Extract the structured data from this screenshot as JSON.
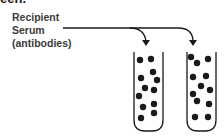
{
  "heading": "een.",
  "label": {
    "line1": "Recipient",
    "line2": "Serum",
    "line3": "(antibodies)"
  },
  "tubes": [
    {
      "name": "tube-1",
      "dots": [
        [
          140,
          60
        ],
        [
          151,
          59
        ],
        [
          153,
          72
        ],
        [
          141,
          78
        ],
        [
          157,
          80
        ],
        [
          145,
          88
        ],
        [
          154,
          90
        ],
        [
          139,
          96
        ],
        [
          143,
          107
        ],
        [
          154,
          104
        ],
        [
          141,
          118
        ],
        [
          154,
          113
        ]
      ]
    },
    {
      "name": "tube-2",
      "dots": [
        [
          191,
          57
        ],
        [
          197,
          63
        ],
        [
          208,
          59
        ],
        [
          193,
          77
        ],
        [
          206,
          76
        ],
        [
          201,
          86
        ],
        [
          210,
          90
        ],
        [
          193,
          94
        ],
        [
          197,
          101
        ],
        [
          209,
          104
        ],
        [
          195,
          117
        ],
        [
          208,
          117
        ]
      ]
    }
  ],
  "colors": {
    "ink": "#1a1a1a"
  }
}
